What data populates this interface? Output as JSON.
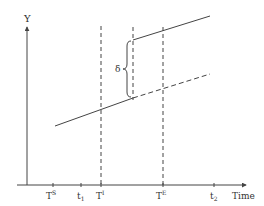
{
  "diagram": {
    "type": "event-study-shift",
    "colors": {
      "stroke": "#444444",
      "text": "#333333",
      "background": "#ffffff"
    },
    "axes": {
      "y_label": "Y",
      "x_label": "Time"
    },
    "ticks": [
      {
        "id": "TS",
        "base": "T",
        "sup": "S",
        "sub": "",
        "x": 53
      },
      {
        "id": "t1",
        "base": "t",
        "sup": "",
        "sub": "1",
        "x": 81
      },
      {
        "id": "TI",
        "base": "T",
        "sup": "I",
        "sub": "",
        "x": 101
      },
      {
        "id": "TE",
        "base": "T",
        "sup": "E",
        "sub": "",
        "x": 163
      },
      {
        "id": "t2",
        "base": "t",
        "sup": "",
        "sub": "2",
        "x": 214
      }
    ],
    "gap_label": "δ",
    "lines": {
      "pre_trend_solid": {
        "x1": 55,
        "y1": 126,
        "x2": 133,
        "y2": 98,
        "style": "solid"
      },
      "counterfactual_dashed": {
        "x1": 133,
        "y1": 98,
        "x2": 210,
        "y2": 74,
        "style": "dashed"
      },
      "post_shift_solid": {
        "x1": 133,
        "y1": 40,
        "x2": 210,
        "y2": 16,
        "style": "solid"
      }
    }
  }
}
